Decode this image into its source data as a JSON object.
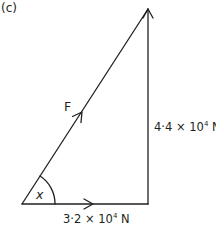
{
  "figure": {
    "part_label": "(c)",
    "type": "vector triangle (right-angled)",
    "colors": {
      "line": "#231f20",
      "background": "#ffffff"
    }
  },
  "vectors": {
    "resultant": {
      "label": "F",
      "direction": "from bottom-left vertex to top vertex"
    },
    "horizontal": {
      "mantissa": "3·2 × 10",
      "exponent": "4",
      "unit": " N",
      "full": "3·2 × 10^4 N",
      "direction": "left to right"
    },
    "vertical": {
      "mantissa": "4·4 × 10",
      "exponent": "4",
      "unit": " N",
      "full": "4·4 × 10^4 N",
      "direction": "bottom to top"
    }
  },
  "angle": {
    "label": "x",
    "location": "between F and horizontal vector at bottom-left vertex"
  }
}
